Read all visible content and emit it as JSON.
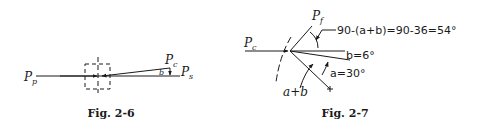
{
  "figures": [
    {
      "id": "fig-2-6",
      "caption": "Fig. 2-6",
      "labels": {
        "p_p_main": "P",
        "p_p_sub": "p",
        "p_c_main": "P",
        "p_c_sub": "c",
        "p_s_main": "P",
        "p_s_sub": "s",
        "angle_b": "b"
      }
    },
    {
      "id": "fig-2-7",
      "caption": "Fig. 2-7",
      "labels": {
        "p_c_main": "P",
        "p_c_sub": "c",
        "p_f_main": "P",
        "p_f_sub": "f",
        "equation": "90-(a+b)=90-36=54°",
        "angle_b": "b=6°",
        "angle_a": "a=30°",
        "sum": "a+b"
      }
    }
  ],
  "colors": {
    "ink": "#1a1a1a",
    "background": "#ffffff"
  }
}
